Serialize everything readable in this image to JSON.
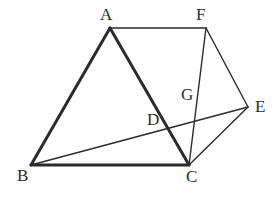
{
  "figure": {
    "type": "geometry-diagram",
    "canvas": {
      "width": 280,
      "height": 199
    },
    "background_color": "#fefefe",
    "stroke_color": "#2b2b2b",
    "thick_stroke_width": 3.0,
    "thin_stroke_width": 1.4,
    "points": [
      {
        "id": "A",
        "label": "A",
        "x": 110,
        "y": 28,
        "label_x": 100,
        "label_y": 6
      },
      {
        "id": "F",
        "label": "F",
        "x": 206,
        "y": 28,
        "label_x": 196,
        "label_y": 6
      },
      {
        "id": "B",
        "label": "B",
        "x": 31,
        "y": 165,
        "label_x": 17,
        "label_y": 167
      },
      {
        "id": "C",
        "label": "C",
        "x": 189,
        "y": 165,
        "label_x": 186,
        "label_y": 168
      },
      {
        "id": "E",
        "label": "E",
        "x": 248,
        "y": 107,
        "label_x": 255,
        "label_y": 98
      },
      {
        "id": "D",
        "label": "D",
        "x": 158,
        "y": 105,
        "label_x": 147,
        "label_y": 111
      },
      {
        "id": "G",
        "label": "G",
        "x": 197,
        "y": 107,
        "label_x": 181,
        "label_y": 86
      }
    ],
    "segments": [
      {
        "id": "AB",
        "from": "A",
        "to": "B",
        "weight": "thick"
      },
      {
        "id": "AC",
        "from": "A",
        "to": "C",
        "weight": "thick"
      },
      {
        "id": "BC",
        "from": "B",
        "to": "C",
        "weight": "thick"
      },
      {
        "id": "AF",
        "from": "A",
        "to": "F",
        "weight": "thin"
      },
      {
        "id": "FC",
        "from": "F",
        "to": "C",
        "weight": "thin"
      },
      {
        "id": "FE",
        "from": "F",
        "to": "E",
        "weight": "thin"
      },
      {
        "id": "EC",
        "from": "E",
        "to": "C",
        "weight": "thin"
      },
      {
        "id": "BE",
        "from": "B",
        "to": "E",
        "weight": "thin"
      }
    ]
  }
}
